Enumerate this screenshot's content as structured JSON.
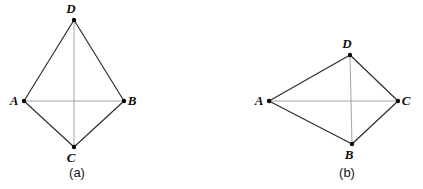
{
  "figure": {
    "background_color": "#ffffff",
    "edge_color": "#2b2b2b",
    "diagonal_color": "#9a9a9a",
    "vertex_color": "#0a0a0a",
    "label_color": "#0d0d0d"
  },
  "panels": [
    {
      "id": "a",
      "caption": "(a)",
      "caption_pos": {
        "x": 77,
        "y": 177
      },
      "vertices": [
        {
          "name": "D",
          "label": "D",
          "x": 74,
          "y": 20,
          "label_x": 71,
          "label_y": 13
        },
        {
          "name": "A",
          "label": "A",
          "x": 24,
          "y": 101,
          "label_x": 14,
          "label_y": 105
        },
        {
          "name": "B",
          "label": "B",
          "x": 124,
          "y": 101,
          "label_x": 132,
          "label_y": 105
        },
        {
          "name": "C",
          "label": "C",
          "x": 74,
          "y": 147,
          "label_x": 71,
          "label_y": 162
        }
      ],
      "outer_edges": [
        {
          "from": "D",
          "to": "A"
        },
        {
          "from": "D",
          "to": "B"
        },
        {
          "from": "A",
          "to": "C"
        },
        {
          "from": "B",
          "to": "C"
        }
      ],
      "diagonals": [
        {
          "from": "A",
          "to": "B"
        },
        {
          "from": "D",
          "to": "C"
        }
      ]
    },
    {
      "id": "b",
      "caption": "(b)",
      "caption_pos": {
        "x": 347,
        "y": 177
      },
      "vertices": [
        {
          "name": "D",
          "label": "D",
          "x": 350,
          "y": 55,
          "label_x": 347,
          "label_y": 48
        },
        {
          "name": "A",
          "label": "A",
          "x": 269,
          "y": 101,
          "label_x": 259,
          "label_y": 105
        },
        {
          "name": "C",
          "label": "C",
          "x": 398,
          "y": 101,
          "label_x": 406,
          "label_y": 105
        },
        {
          "name": "B",
          "label": "B",
          "x": 352,
          "y": 144,
          "label_x": 349,
          "label_y": 159
        }
      ],
      "outer_edges": [
        {
          "from": "D",
          "to": "A"
        },
        {
          "from": "D",
          "to": "C"
        },
        {
          "from": "A",
          "to": "B"
        },
        {
          "from": "C",
          "to": "B"
        }
      ],
      "diagonals": [
        {
          "from": "A",
          "to": "C"
        },
        {
          "from": "D",
          "to": "B"
        }
      ]
    }
  ]
}
